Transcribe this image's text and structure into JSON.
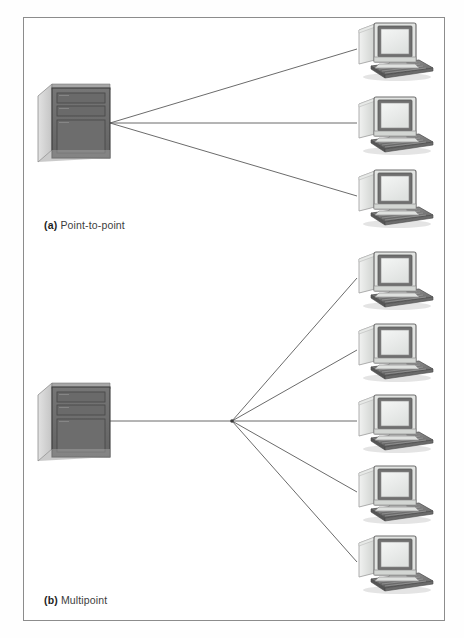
{
  "figure": {
    "width": 464,
    "height": 638,
    "background_color": "#fefefe",
    "frame": {
      "x": 23,
      "y": 17,
      "width": 422,
      "height": 604,
      "border_color": "#8c8c8c"
    },
    "line_color": "#5a5a5a",
    "icon_colors": {
      "server_front": "#6b6b6b",
      "server_top": "#a9a9a9",
      "server_side": "#d6d6d6",
      "server_outline": "#3f3f3f",
      "monitor_bezel": "#6f6f6f",
      "monitor_screen": "#eef0ef",
      "monitor_case": "#d8dad8",
      "monitor_case_light": "#ededed",
      "keyboard": "#7a7a7a",
      "keyboard_dark": "#5e5e5e",
      "shadow": "#bfbfbf"
    }
  },
  "panels": [
    {
      "id": "point-to-point",
      "caption_tag": "(a)",
      "caption_text": "Point-to-point",
      "server_label": "mainframe-server",
      "terminal_count": 3,
      "topology": "Each terminal has its own dedicated link to the server",
      "server": {
        "x": 38,
        "y": 84,
        "width": 72,
        "height": 78
      },
      "hub": {
        "x": 110,
        "y": 123
      },
      "terminals": [
        {
          "index": 1,
          "connect_x": 355,
          "connect_y": 49
        },
        {
          "index": 2,
          "connect_x": 355,
          "connect_y": 123
        },
        {
          "index": 3,
          "connect_x": 355,
          "connect_y": 196
        }
      ]
    },
    {
      "id": "multipoint",
      "caption_tag": "(b)",
      "caption_text": "Multipoint",
      "server_label": "mainframe-server",
      "terminal_count": 5,
      "topology": "All terminals share a single common link to the server",
      "server": {
        "x": 38,
        "y": 383,
        "width": 72,
        "height": 78
      },
      "hub": {
        "x": 232,
        "y": 421
      },
      "terminals": [
        {
          "index": 1,
          "connect_x": 355,
          "connect_y": 278
        },
        {
          "index": 2,
          "connect_x": 355,
          "connect_y": 350
        },
        {
          "index": 3,
          "connect_x": 355,
          "connect_y": 421
        },
        {
          "index": 4,
          "connect_x": 355,
          "connect_y": 492
        },
        {
          "index": 5,
          "connect_x": 355,
          "connect_y": 562
        }
      ]
    }
  ],
  "icons": {
    "server": "server-tower-icon",
    "terminal": "desktop-computer-icon",
    "link": "connection-line"
  }
}
